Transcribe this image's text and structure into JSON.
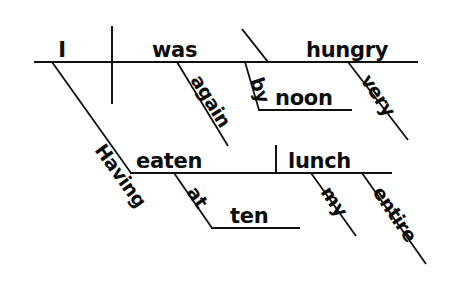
{
  "diagram": {
    "type": "reed-kellogg-sentence-diagram",
    "sentence": "Having eaten my entire lunch at ten, I was very hungry again by noon.",
    "ink_color": "#111111",
    "background_color": "#ffffff",
    "main_clause": {
      "subject": "I",
      "verb": "was",
      "predicate_adjective": "hungry",
      "modifiers": [
        {
          "word": "again",
          "attaches_to": "was"
        },
        {
          "word": "very",
          "attaches_to": "hungry"
        }
      ],
      "prepositional_phrase": {
        "preposition": "by",
        "object": "noon",
        "attaches_to": "was"
      }
    },
    "participial_phrase": {
      "participle": "Having eaten",
      "participle_part_1": "Having",
      "participle_part_2": "eaten",
      "direct_object": "lunch",
      "modifiers": [
        {
          "word": "my",
          "attaches_to": "lunch"
        },
        {
          "word": "entire",
          "attaches_to": "lunch"
        }
      ],
      "prepositional_phrase": {
        "preposition": "at",
        "object": "ten",
        "attaches_to": "eaten"
      }
    },
    "words": {
      "subject": "I",
      "verb": "was",
      "pred_adj": "hungry",
      "again": "again",
      "very": "very",
      "by": "by",
      "noon": "noon",
      "having": "Having",
      "eaten": "eaten",
      "lunch": "lunch",
      "at": "at",
      "ten": "ten",
      "my": "my",
      "entire": "entire"
    }
  }
}
